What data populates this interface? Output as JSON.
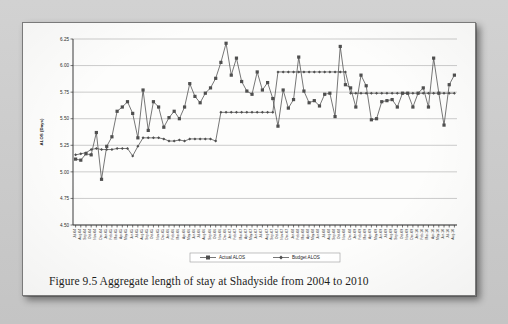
{
  "page": {
    "caption": "Figure 9.5 Aggregate length of stay at Shadyside from 2004 to 2010"
  },
  "chart_data": {
    "type": "line",
    "title": "",
    "xlabel": "",
    "ylabel": "ALOS (Days)",
    "ylim": [
      4.5,
      6.25
    ],
    "yticks": [
      4.5,
      4.75,
      5.0,
      5.25,
      5.5,
      5.75,
      6.0,
      6.25
    ],
    "ytick_labels": [
      "4.50",
      "4.75",
      "5.00",
      "5.25",
      "5.50",
      "5.75",
      "6.00",
      "6.25"
    ],
    "grid": true,
    "legend_position": "bottom",
    "categories": [
      "Jul-04",
      "Aug-04",
      "Sep-04",
      "Oct-04",
      "Nov-04",
      "Dec-04",
      "Jan-05",
      "Feb-05",
      "Mar-05",
      "Apr-05",
      "May-05",
      "Jun-05",
      "Jul-05",
      "Aug-05",
      "Sep-05",
      "Oct-05",
      "Nov-05",
      "Dec-05",
      "Jan-06",
      "Feb-06",
      "Mar-06",
      "Apr-06",
      "May-06",
      "Jun-06",
      "Jul-06",
      "Aug-06",
      "Sep-06",
      "Oct-06",
      "Nov-06",
      "Dec-06",
      "Jan-07",
      "Feb-07",
      "Mar-07",
      "Apr-07",
      "May-07",
      "Jun-07",
      "Jul-07",
      "Aug-07",
      "Sep-07",
      "Oct-07",
      "Nov-07",
      "Dec-07",
      "Jan-08",
      "Feb-08",
      "Mar-08",
      "Apr-08",
      "May-08",
      "Jun-08",
      "Jul-08",
      "Aug-08",
      "Sep-08",
      "Oct-08",
      "Nov-08",
      "Dec-08",
      "Jan-09",
      "Feb-09",
      "Mar-09",
      "Apr-09",
      "May-09",
      "Jun-09",
      "Jul-09",
      "Aug-09",
      "Sep-09",
      "Oct-09",
      "Nov-09",
      "Dec-09",
      "Jan-10",
      "Feb-10",
      "Mar-10",
      "Apr-10",
      "May-10",
      "Jun-10",
      "Jul-10",
      "Aug-10"
    ],
    "series": [
      {
        "name": "Actual ALOS",
        "marker": "square",
        "values": [
          5.12,
          5.11,
          5.17,
          5.16,
          5.37,
          4.93,
          5.24,
          5.33,
          5.57,
          5.61,
          5.66,
          5.55,
          5.32,
          5.77,
          5.39,
          5.66,
          5.61,
          5.42,
          5.51,
          5.57,
          5.5,
          5.61,
          5.83,
          5.71,
          5.65,
          5.74,
          5.79,
          5.88,
          6.03,
          6.21,
          5.91,
          6.07,
          5.85,
          5.76,
          5.73,
          5.94,
          5.77,
          5.84,
          5.69,
          5.43,
          5.77,
          5.6,
          5.68,
          6.08,
          5.76,
          5.65,
          5.67,
          5.62,
          5.73,
          5.74,
          5.52,
          6.18,
          5.82,
          5.79,
          5.61,
          5.91,
          5.81,
          5.49,
          5.5,
          5.66,
          5.67,
          5.68,
          5.61,
          5.74,
          5.74,
          5.61,
          5.74,
          5.79,
          5.61,
          6.07,
          5.74,
          5.44,
          5.82,
          5.91
        ]
      },
      {
        "name": "Budget ALOS",
        "marker": "diamond",
        "values": [
          5.16,
          5.17,
          5.18,
          5.21,
          5.22,
          5.21,
          5.21,
          5.21,
          5.22,
          5.22,
          5.22,
          5.15,
          5.24,
          5.32,
          5.32,
          5.32,
          5.32,
          5.31,
          5.29,
          5.29,
          5.3,
          5.29,
          5.31,
          5.31,
          5.31,
          5.31,
          5.31,
          5.29,
          5.56,
          5.56,
          5.56,
          5.56,
          5.56,
          5.56,
          5.56,
          5.56,
          5.56,
          5.56,
          5.56,
          5.94,
          5.94,
          5.94,
          5.94,
          5.94,
          5.94,
          5.94,
          5.94,
          5.94,
          5.94,
          5.94,
          5.94,
          5.94,
          5.94,
          5.74,
          5.74,
          5.74,
          5.74,
          5.74,
          5.74,
          5.74,
          5.74,
          5.74,
          5.74,
          5.74,
          5.74,
          5.74,
          5.74,
          5.74,
          5.74,
          5.74,
          5.74,
          5.74,
          5.74,
          5.74
        ]
      }
    ]
  }
}
